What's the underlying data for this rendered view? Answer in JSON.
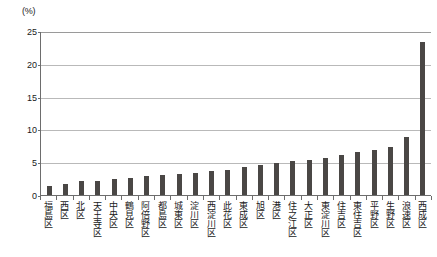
{
  "chart": {
    "y_axis_unit_label": "(%)",
    "y_tick_labels": [
      "0",
      "5",
      "10",
      "15",
      "20",
      "25"
    ]
  },
  "chart_data": {
    "type": "bar",
    "title": "",
    "subtitle": "",
    "xlabel": "",
    "ylabel": "(%)",
    "ylim": [
      0,
      25
    ],
    "ytick_interval": 5,
    "yticks": [
      0,
      5,
      10,
      15,
      20,
      25
    ],
    "grid": true,
    "legend": false,
    "bar_color": "#4a4745",
    "categories": [
      "福島区",
      "西区",
      "北区",
      "天王寺区",
      "中央区",
      "鶴見区",
      "阿倍野区",
      "都島区",
      "城東区",
      "淀川区",
      "西淀川区",
      "此花区",
      "東成区",
      "旭区",
      "港区",
      "住之江区",
      "大正区",
      "東淀川区",
      "住吉区",
      "東住吉区",
      "平野区",
      "生野区",
      "浪速区",
      "西成区"
    ],
    "values": [
      1.3,
      1.7,
      2.1,
      2.1,
      2.4,
      2.6,
      2.9,
      3.0,
      3.2,
      3.4,
      3.6,
      3.8,
      4.2,
      4.6,
      4.9,
      5.2,
      5.4,
      5.6,
      6.1,
      6.5,
      6.8,
      7.3,
      8.8,
      23.3
    ]
  }
}
